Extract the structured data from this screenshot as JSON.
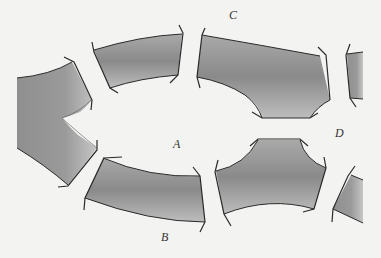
{
  "diagram": {
    "labels": {
      "A": "A",
      "B": "B",
      "C": "C",
      "D": "D"
    },
    "colors": {
      "background": "#f3f3f1",
      "band_fill_dark": "#8a8a8a",
      "band_fill_light": "#c9c9c9",
      "outline": "#2a2a2a"
    }
  }
}
